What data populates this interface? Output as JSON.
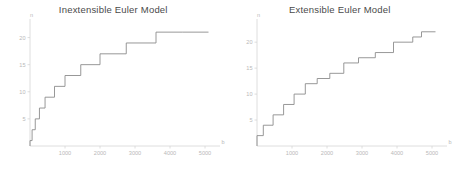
{
  "figure": {
    "background": "#ffffff",
    "line_color": "#8c8c8c",
    "axis_color": "#d6d6d6",
    "tick_label_color": "#b9b9b9",
    "title_color": "#4a4a4a"
  },
  "panels": [
    {
      "key": "inextensible",
      "title": "Inextensible Euler Model"
    },
    {
      "key": "extensible",
      "title": "Extensible Euler Model"
    }
  ],
  "axis_labels": {
    "x": "b",
    "y": "n"
  },
  "ticks": {
    "x": [
      "1000",
      "2000",
      "3000",
      "4000",
      "5000"
    ],
    "y": [
      "5",
      "10",
      "15",
      "20"
    ]
  },
  "chart_data": [
    {
      "type": "line",
      "title": "Inextensible Euler Model",
      "xlabel": "b",
      "ylabel": "n",
      "xlim": [
        0,
        5200
      ],
      "ylim": [
        0,
        22.5
      ],
      "xticks": [
        1000,
        2000,
        3000,
        4000,
        5000
      ],
      "yticks": [
        5,
        10,
        15,
        20
      ],
      "grid": false,
      "legend": null,
      "drawstyle": "steps-post",
      "x": [
        0,
        60,
        150,
        270,
        430,
        620,
        850,
        1130,
        1470,
        1880,
        2360,
        2930,
        3560,
        4280,
        5100
      ],
      "y": [
        1,
        3,
        5,
        7,
        9,
        11,
        13,
        15,
        17,
        19,
        21,
        21,
        21,
        21,
        21
      ],
      "steps": [
        {
          "x_start": 0,
          "x_end": 60,
          "n": 1
        },
        {
          "x_start": 60,
          "x_end": 150,
          "n": 3
        },
        {
          "x_start": 150,
          "x_end": 270,
          "n": 5
        },
        {
          "x_start": 270,
          "x_end": 430,
          "n": 7
        },
        {
          "x_start": 430,
          "x_end": 700,
          "n": 9
        },
        {
          "x_start": 700,
          "x_end": 1000,
          "n": 11
        },
        {
          "x_start": 1000,
          "x_end": 1450,
          "n": 13
        },
        {
          "x_start": 1450,
          "x_end": 2000,
          "n": 15
        },
        {
          "x_start": 2000,
          "x_end": 2750,
          "n": 17
        },
        {
          "x_start": 2750,
          "x_end": 3600,
          "n": 19
        },
        {
          "x_start": 3600,
          "x_end": 4350,
          "n": 21
        },
        {
          "x_start": 4350,
          "x_end": 5100,
          "n": 21
        }
      ]
    },
    {
      "type": "line",
      "title": "Extensible Euler Model",
      "xlabel": "b",
      "ylabel": "n",
      "xlim": [
        0,
        5200
      ],
      "ylim": [
        0,
        23.5
      ],
      "xticks": [
        1000,
        2000,
        3000,
        4000,
        5000
      ],
      "yticks": [
        5,
        10,
        15,
        20
      ],
      "grid": false,
      "legend": null,
      "drawstyle": "steps-post",
      "x": [
        0,
        180,
        460,
        760,
        1060,
        1380,
        1720,
        2080,
        2480,
        2900,
        3380,
        3900,
        4450,
        4700,
        5100
      ],
      "y": [
        2,
        4,
        6,
        8,
        10,
        12,
        13,
        14,
        16,
        17,
        18,
        20,
        21,
        22,
        22
      ],
      "steps": [
        {
          "x_start": 0,
          "x_end": 180,
          "n": 2
        },
        {
          "x_start": 180,
          "x_end": 460,
          "n": 4
        },
        {
          "x_start": 460,
          "x_end": 760,
          "n": 6
        },
        {
          "x_start": 760,
          "x_end": 1060,
          "n": 8
        },
        {
          "x_start": 1060,
          "x_end": 1380,
          "n": 10
        },
        {
          "x_start": 1380,
          "x_end": 1720,
          "n": 12
        },
        {
          "x_start": 1720,
          "x_end": 2080,
          "n": 13
        },
        {
          "x_start": 2080,
          "x_end": 2480,
          "n": 14
        },
        {
          "x_start": 2480,
          "x_end": 2900,
          "n": 16
        },
        {
          "x_start": 2900,
          "x_end": 3380,
          "n": 17
        },
        {
          "x_start": 3380,
          "x_end": 3900,
          "n": 18
        },
        {
          "x_start": 3900,
          "x_end": 4450,
          "n": 20
        },
        {
          "x_start": 4450,
          "x_end": 4700,
          "n": 21
        },
        {
          "x_start": 4700,
          "x_end": 5100,
          "n": 22
        }
      ]
    }
  ]
}
